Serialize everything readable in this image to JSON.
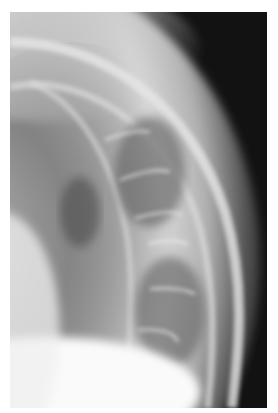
{
  "image": {
    "kind": "radiograph",
    "description": "Grayscale X-ray showing curved bony arc with parallel rib-like linear structures",
    "colors": {
      "background": "#ffffff",
      "dark_field": "#121212",
      "tissue_mid": "#8a8a8a",
      "bone_bright": "#f4f4f4"
    }
  }
}
